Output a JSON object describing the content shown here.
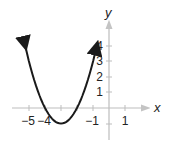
{
  "chart_data": {
    "type": "line",
    "title": "",
    "xlabel": "x",
    "ylabel": "y",
    "function": "y = (x + 3)^2 - 1",
    "vertex": [
      -3,
      -1
    ],
    "x_intercepts": [
      -4,
      -2
    ],
    "x_tick_labels": [
      "−5",
      "−4",
      "−1",
      "1"
    ],
    "x_tick_values": [
      -5,
      -4,
      -1,
      1
    ],
    "y_tick_labels": [
      "1",
      "2",
      "3",
      "4"
    ],
    "y_tick_values": [
      1,
      2,
      3,
      4
    ],
    "xlim": [
      -6,
      2
    ],
    "ylim": [
      -2,
      5
    ],
    "grid": false,
    "series": [
      {
        "name": "parabola",
        "x": [
          -5.24,
          -5,
          -4.5,
          -4,
          -3.5,
          -3,
          -2.5,
          -2,
          -1.5,
          -1,
          -0.76
        ],
        "y": [
          4,
          3,
          1.25,
          0,
          -0.75,
          -1,
          -0.75,
          0,
          1.25,
          3,
          4
        ]
      }
    ],
    "colors": {
      "curve": "#1a1a1a",
      "axis": "#b8b8b8",
      "text": "#222222"
    }
  }
}
